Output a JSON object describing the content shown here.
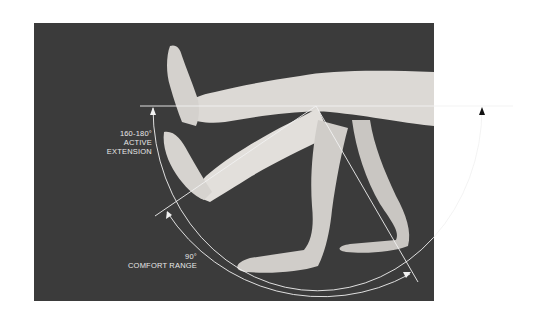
{
  "figure": {
    "background_color": "#ffffff",
    "photo_color": "#3b3b3b",
    "line_color": "#f2f2f2"
  },
  "labels": {
    "active_extension": {
      "angle": "160-180°",
      "text": "ACTIVE EXTENSION"
    },
    "comfort_range": {
      "angle": "90°",
      "text": "COMFORT RANGE"
    }
  }
}
